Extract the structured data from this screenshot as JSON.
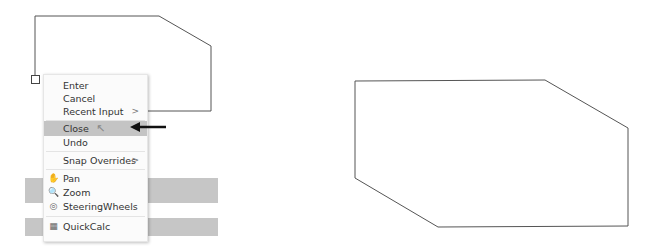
{
  "context_menu": {
    "items": [
      {
        "label": "Enter",
        "has_submenu": false
      },
      {
        "label": "Cancel",
        "has_submenu": false
      },
      {
        "label": "Recent Input",
        "has_submenu": true
      },
      {
        "label": "Close",
        "has_submenu": false,
        "highlighted": true
      },
      {
        "label": "Undo",
        "has_submenu": false
      },
      {
        "label": "Snap Overrides",
        "has_submenu": true
      },
      {
        "label": "Pan",
        "icon": "pan-icon"
      },
      {
        "label": "Zoom",
        "icon": "zoom-icon"
      },
      {
        "label": "SteeringWheels",
        "icon": "steeringwheels-icon"
      },
      {
        "label": "QuickCalc",
        "icon": "quickcalc-icon"
      }
    ],
    "submenu_glyph": ">"
  },
  "colors": {
    "highlight": "#c4c4c4",
    "line": "#555555",
    "arrow": "#111111"
  }
}
